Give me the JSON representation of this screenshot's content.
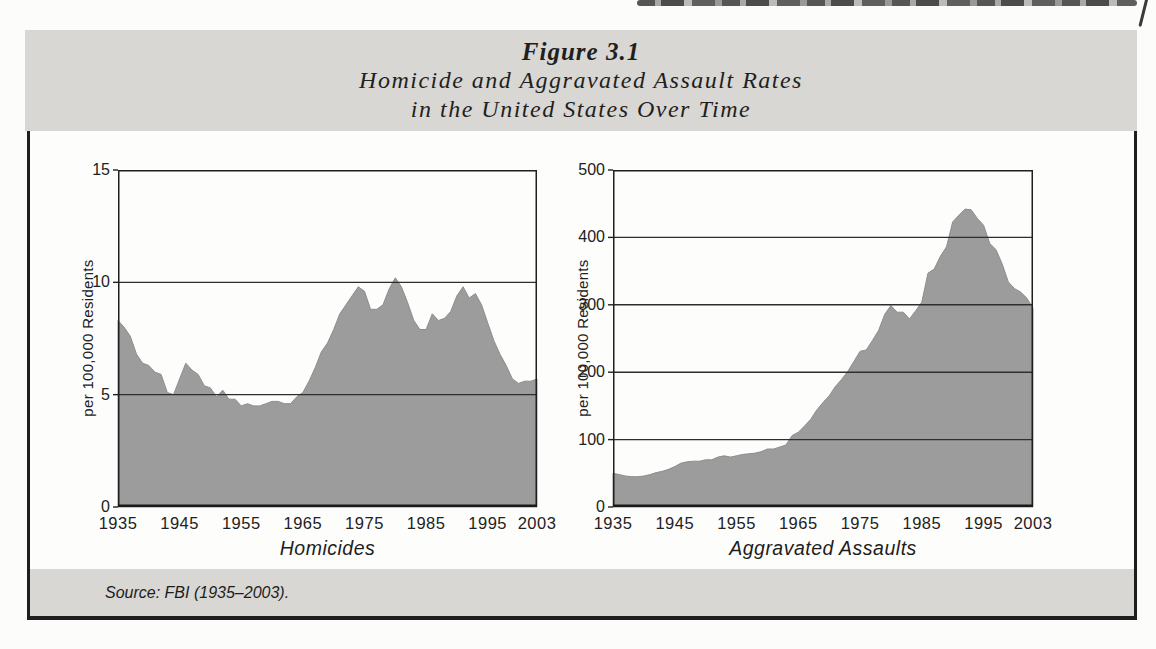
{
  "figure": {
    "label": "Figure 3.1",
    "title_line1": "Homicide and Aggravated Assault Rates",
    "title_line2": "in the United States Over Time",
    "source": "Source: FBI (1935–2003).",
    "band_color": "#d8d7d3",
    "border_color": "#1e1e1e"
  },
  "chart_data": [
    {
      "type": "area",
      "name": "homicides",
      "title": "Homicides",
      "ylabel": "per 100,000 Residents",
      "ylim": [
        0,
        15
      ],
      "yticks": [
        0,
        5,
        10,
        15
      ],
      "xticks": [
        "1935",
        "1945",
        "1955",
        "1965",
        "1975",
        "1985",
        "1995",
        "2003"
      ],
      "x_range": [
        1935,
        2003
      ],
      "grid": true,
      "fill": "#9c9c9c",
      "years": [
        1935,
        1936,
        1937,
        1938,
        1939,
        1940,
        1941,
        1942,
        1943,
        1944,
        1945,
        1946,
        1947,
        1948,
        1949,
        1950,
        1951,
        1952,
        1953,
        1954,
        1955,
        1956,
        1957,
        1958,
        1959,
        1960,
        1961,
        1962,
        1963,
        1964,
        1965,
        1966,
        1967,
        1968,
        1969,
        1970,
        1971,
        1972,
        1973,
        1974,
        1975,
        1976,
        1977,
        1978,
        1979,
        1980,
        1981,
        1982,
        1983,
        1984,
        1985,
        1986,
        1987,
        1988,
        1989,
        1990,
        1991,
        1992,
        1993,
        1994,
        1995,
        1996,
        1997,
        1998,
        1999,
        2000,
        2001,
        2002,
        2003
      ],
      "values": [
        8.3,
        8.0,
        7.6,
        6.8,
        6.4,
        6.3,
        6.0,
        5.9,
        5.1,
        5.0,
        5.7,
        6.4,
        6.1,
        5.9,
        5.4,
        5.3,
        4.9,
        5.2,
        4.8,
        4.8,
        4.5,
        4.6,
        4.5,
        4.5,
        4.6,
        4.7,
        4.7,
        4.6,
        4.6,
        4.9,
        5.1,
        5.6,
        6.2,
        6.9,
        7.3,
        7.9,
        8.6,
        9.0,
        9.4,
        9.8,
        9.6,
        8.8,
        8.8,
        9.0,
        9.7,
        10.2,
        9.8,
        9.1,
        8.3,
        7.9,
        7.9,
        8.6,
        8.3,
        8.4,
        8.7,
        9.4,
        9.8,
        9.3,
        9.5,
        9.0,
        8.2,
        7.4,
        6.8,
        6.3,
        5.7,
        5.5,
        5.6,
        5.6,
        5.7
      ]
    },
    {
      "type": "area",
      "name": "aggravated-assaults",
      "title": "Aggravated Assaults",
      "ylabel": "per 100,000 Residents",
      "ylim": [
        0,
        500
      ],
      "yticks": [
        0,
        100,
        200,
        300,
        400,
        500
      ],
      "xticks": [
        "1935",
        "1945",
        "1955",
        "1965",
        "1975",
        "1985",
        "1995",
        "2003"
      ],
      "x_range": [
        1935,
        2003
      ],
      "grid": true,
      "fill": "#9c9c9c",
      "years": [
        1935,
        1936,
        1937,
        1938,
        1939,
        1940,
        1941,
        1942,
        1943,
        1944,
        1945,
        1946,
        1947,
        1948,
        1949,
        1950,
        1951,
        1952,
        1953,
        1954,
        1955,
        1956,
        1957,
        1958,
        1959,
        1960,
        1961,
        1962,
        1963,
        1964,
        1965,
        1966,
        1967,
        1968,
        1969,
        1970,
        1971,
        1972,
        1973,
        1974,
        1975,
        1976,
        1977,
        1978,
        1979,
        1980,
        1981,
        1982,
        1983,
        1984,
        1985,
        1986,
        1987,
        1988,
        1989,
        1990,
        1991,
        1992,
        1993,
        1994,
        1995,
        1996,
        1997,
        1998,
        1999,
        2000,
        2001,
        2002,
        2003
      ],
      "values": [
        50,
        48,
        46,
        45,
        45,
        46,
        48,
        51,
        53,
        56,
        60,
        65,
        67,
        68,
        68,
        70,
        70,
        74,
        76,
        74,
        76,
        78,
        79,
        80,
        82,
        86,
        86,
        89,
        92,
        106,
        111,
        120,
        130,
        144,
        155,
        165,
        179,
        189,
        201,
        216,
        231,
        233,
        247,
        262,
        286,
        299,
        289,
        289,
        279,
        291,
        304,
        347,
        353,
        372,
        386,
        423,
        433,
        442,
        441,
        428,
        418,
        391,
        382,
        361,
        334,
        324,
        319,
        310,
        295
      ]
    }
  ]
}
